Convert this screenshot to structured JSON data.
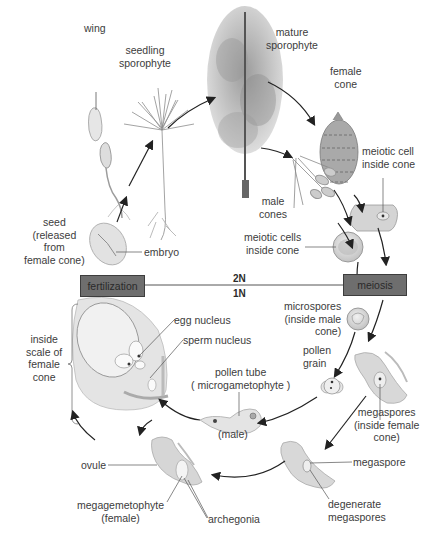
{
  "colors": {
    "background": "#ffffff",
    "box_fill": "#6e6e6e",
    "box_border": "#3d3d3d",
    "arrow": "#222222",
    "label_text": "#3c3c3c",
    "illustration": "#c9c9c9"
  },
  "stages": {
    "wing": "wing",
    "seedling_sporophyte": [
      "seedling",
      "sporophyte"
    ],
    "mature_sporophyte": [
      "mature",
      "sporophyte"
    ],
    "female_cone": [
      "female",
      "cone"
    ],
    "male_cones": [
      "male",
      "cones"
    ],
    "meiotic_cell_inside_cone": [
      "meiotic cell",
      "inside cone"
    ],
    "meiotic_cells_inside_cone": [
      "meiotic cells",
      "inside cone"
    ],
    "seed": [
      "seed",
      "(released",
      "from",
      "female cone)"
    ],
    "embryo": "embryo",
    "microspores": [
      "microspores",
      "(inside male",
      "cone)"
    ],
    "pollen_grain": [
      "pollen",
      "grain"
    ],
    "pollen_tube": [
      "pollen tube",
      "( microgametophyte )"
    ],
    "male": "(male)",
    "megaspores": [
      "megaspores",
      "(inside female",
      "cone)"
    ],
    "megaspore": "megaspore",
    "degenerate_megaspores": [
      "degenerate",
      "megaspores"
    ],
    "ovule": "ovule",
    "megagametophyte": [
      "megagemetophyte",
      "(female)"
    ],
    "archegonia": "archegonia",
    "egg_nucleus": "egg nucleus",
    "sperm_nucleus": "sperm nucleus",
    "inside_scale": [
      "inside",
      "scale of",
      "female",
      "cone"
    ]
  },
  "process_boxes": {
    "fertilization": "fertilization",
    "meiosis": "meiosis"
  },
  "ploidy": {
    "diploid": "2N",
    "haploid": "1N"
  }
}
